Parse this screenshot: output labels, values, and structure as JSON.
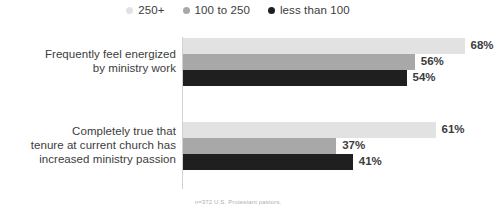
{
  "chart_data": {
    "type": "bar",
    "orientation": "horizontal",
    "title": "",
    "xlabel": "",
    "ylabel": "",
    "xlim": [
      0,
      100
    ],
    "grid": false,
    "legend_position": "top-center",
    "value_suffix": "%",
    "categories": [
      "Frequently feel energized by ministry work",
      "Completely true that tenure at current church has increased ministry passion"
    ],
    "series": [
      {
        "name": "250+",
        "color": "#e2e2e2",
        "values": [
          68,
          61
        ]
      },
      {
        "name": "100 to 250",
        "color": "#a8a8a8",
        "values": [
          56,
          37
        ]
      },
      {
        "name": "less than 100",
        "color": "#1f1f1f",
        "values": [
          54,
          41
        ]
      }
    ],
    "labels": [
      [
        "68%",
        "56%",
        "54%"
      ],
      [
        "61%",
        "37%",
        "41%"
      ]
    ],
    "annotations": [
      "n=372 U.S. Protestant pastors."
    ]
  },
  "legend": {
    "items": [
      {
        "label": "250+",
        "color": "#e2e2e2"
      },
      {
        "label": "100 to 250",
        "color": "#a8a8a8"
      },
      {
        "label": "less than 100",
        "color": "#1f1f1f"
      }
    ]
  },
  "groups": [
    {
      "label": "Frequently feel energized by ministry work",
      "label_line1": "Frequently feel energized",
      "label_line2": "by ministry work",
      "bars": [
        {
          "series": "250+",
          "value": 68,
          "label": "68%",
          "color": "#e2e2e2"
        },
        {
          "series": "100 to 250",
          "value": 56,
          "label": "56%",
          "color": "#a8a8a8"
        },
        {
          "series": "less than 100",
          "value": 54,
          "label": "54%",
          "color": "#1f1f1f"
        }
      ]
    },
    {
      "label": "Completely true that tenure at current church has increased ministry passion",
      "label_line1": "Completely true that",
      "label_line2": "tenure at current church has",
      "label_line3": "increased ministry passion",
      "bars": [
        {
          "series": "250+",
          "value": 61,
          "label": "61%",
          "color": "#e2e2e2"
        },
        {
          "series": "100 to 250",
          "value": 37,
          "label": "37%",
          "color": "#a8a8a8"
        },
        {
          "series": "less than 100",
          "value": 41,
          "label": "41%",
          "color": "#1f1f1f"
        }
      ]
    }
  ],
  "footnote": {
    "text": "n=372 U.S. Protestant pastors."
  },
  "scale": {
    "px_per_percent": 4.14
  }
}
